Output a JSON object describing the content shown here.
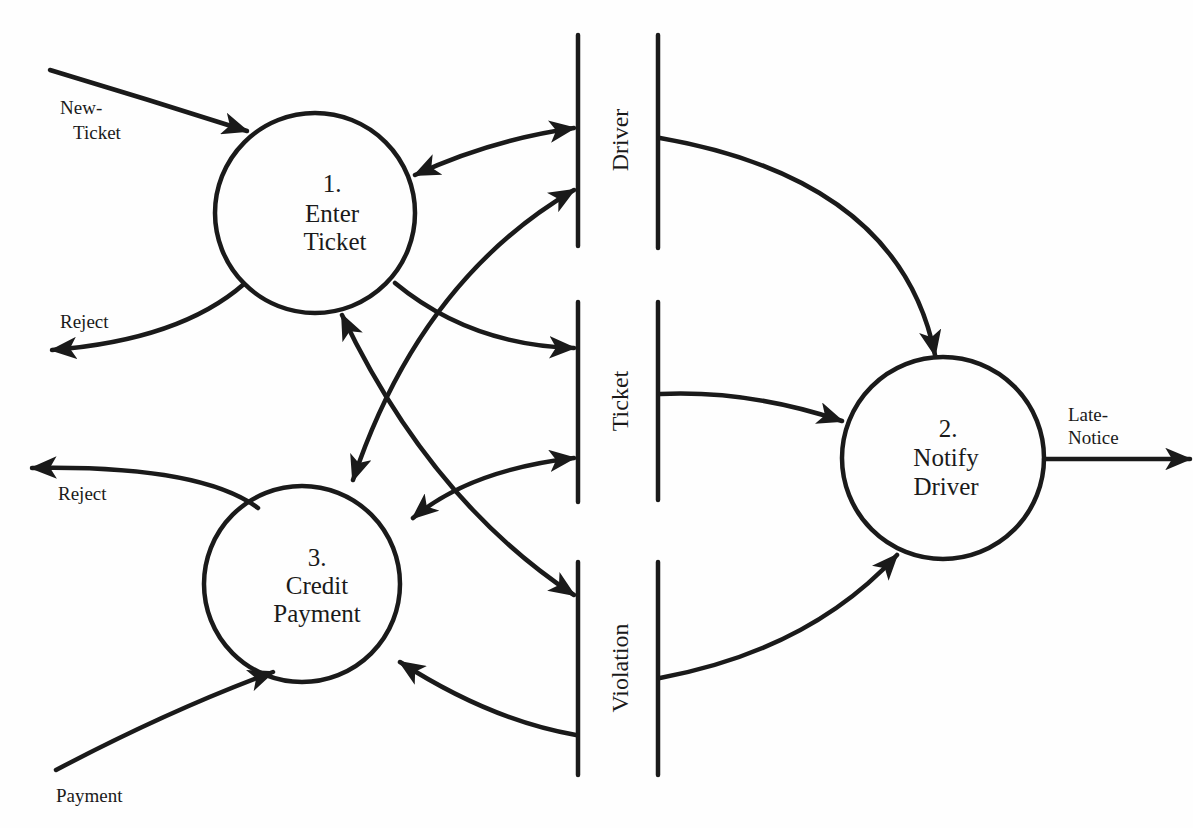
{
  "diagram": {
    "type": "data-flow-diagram",
    "processes": [
      {
        "id": "p1",
        "number": "1.",
        "line1": "Enter",
        "line2": "Ticket"
      },
      {
        "id": "p2",
        "number": "2.",
        "line1": "Notify",
        "line2": "Driver"
      },
      {
        "id": "p3",
        "number": "3.",
        "line1": "Credit",
        "line2": "Payment"
      }
    ],
    "stores": [
      {
        "id": "s1",
        "label": "Driver"
      },
      {
        "id": "s2",
        "label": "Ticket"
      },
      {
        "id": "s3",
        "label": "Violation"
      }
    ],
    "flows": [
      {
        "id": "f1",
        "line1": "New-",
        "line2": "Ticket",
        "from": "external",
        "to": "p1"
      },
      {
        "id": "f2",
        "label": "Reject",
        "from": "p1",
        "to": "external"
      },
      {
        "id": "f3",
        "label": "Reject",
        "from": "p3",
        "to": "external"
      },
      {
        "id": "f4",
        "label": "Payment",
        "from": "external",
        "to": "p3"
      },
      {
        "id": "f5",
        "line1": "Late-",
        "line2": "Notice",
        "from": "p2",
        "to": "external"
      },
      {
        "id": "f6",
        "label": "",
        "from": "p1",
        "to": "s1",
        "bidirectional": true
      },
      {
        "id": "f7",
        "label": "",
        "from": "p1",
        "to": "s2"
      },
      {
        "id": "f8",
        "label": "",
        "from": "p1",
        "to": "s3",
        "bidirectional": true
      },
      {
        "id": "f9",
        "label": "",
        "from": "p3",
        "to": "s1",
        "bidirectional": true
      },
      {
        "id": "f10",
        "label": "",
        "from": "p3",
        "to": "s2",
        "bidirectional": true
      },
      {
        "id": "f11",
        "label": "",
        "from": "s3",
        "to": "p3"
      },
      {
        "id": "f12",
        "label": "",
        "from": "s1",
        "to": "p2"
      },
      {
        "id": "f13",
        "label": "",
        "from": "s2",
        "to": "p2"
      },
      {
        "id": "f14",
        "label": "",
        "from": "s3",
        "to": "p2"
      }
    ]
  }
}
